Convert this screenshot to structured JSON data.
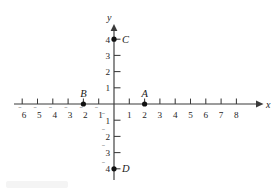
{
  "figure": {
    "background_color": "#ffffff",
    "line_color": "#3a3a3a",
    "point_color": "#111111",
    "text_color": "#262626"
  },
  "axes": {
    "x_axis_label": "x",
    "y_axis_label": "y",
    "origin_px": {
      "x": 114,
      "y": 104
    },
    "unit_px": {
      "x": 15.3,
      "y": 16.2
    },
    "x_range": [
      -6.6,
      9.4
    ],
    "y_range": [
      -4.8,
      4.7
    ],
    "x_tick_values": [
      -6,
      -5,
      -4,
      -3,
      -2,
      -1,
      1,
      2,
      3,
      4,
      5,
      6,
      7,
      8
    ],
    "y_tick_values": [
      4,
      3,
      2,
      1,
      -1,
      -2,
      -3,
      -4
    ],
    "x_tick_labels": [
      {
        "value": -6,
        "negative": true,
        "digits": "6"
      },
      {
        "value": -5,
        "negative": true,
        "digits": "5"
      },
      {
        "value": -4,
        "negative": true,
        "digits": "4"
      },
      {
        "value": -3,
        "negative": true,
        "digits": "3"
      },
      {
        "value": -2,
        "negative": true,
        "digits": "2"
      },
      {
        "value": -1,
        "negative": true,
        "digits": "1"
      },
      {
        "value": 1,
        "negative": false,
        "digits": "1"
      },
      {
        "value": 2,
        "negative": false,
        "digits": "2"
      },
      {
        "value": 3,
        "negative": false,
        "digits": "3"
      },
      {
        "value": 4,
        "negative": false,
        "digits": "4"
      },
      {
        "value": 5,
        "negative": false,
        "digits": "5"
      },
      {
        "value": 6,
        "negative": false,
        "digits": "6"
      },
      {
        "value": 7,
        "negative": false,
        "digits": "7"
      },
      {
        "value": 8,
        "negative": false,
        "digits": "8"
      }
    ],
    "y_tick_labels": [
      {
        "value": 4,
        "negative": false,
        "digits": "4"
      },
      {
        "value": 3,
        "negative": false,
        "digits": "3"
      },
      {
        "value": 2,
        "negative": false,
        "digits": "2"
      },
      {
        "value": 1,
        "negative": false,
        "digits": "1"
      },
      {
        "value": -1,
        "negative": true,
        "digits": "1"
      },
      {
        "value": -2,
        "negative": true,
        "digits": "2"
      },
      {
        "value": -3,
        "negative": true,
        "digits": "3"
      },
      {
        "value": -4,
        "negative": true,
        "digits": "4"
      }
    ],
    "minus_glyph": "⁻",
    "arrow_on_x_right": true,
    "arrow_on_y_top": true,
    "grid": false
  },
  "chart_data": {
    "type": "scatter",
    "title": "",
    "xlabel": "x",
    "ylabel": "y",
    "xlim": [
      -6.6,
      9.4
    ],
    "ylim": [
      -4.8,
      4.7
    ],
    "grid": false,
    "legend": "none",
    "points": [
      {
        "label": "A",
        "x": 2,
        "y": 0,
        "label_position": "above"
      },
      {
        "label": "B",
        "x": -2,
        "y": 0,
        "label_position": "above"
      },
      {
        "label": "C",
        "x": 0,
        "y": 4,
        "label_position": "right"
      },
      {
        "label": "D",
        "x": 0,
        "y": -4,
        "label_position": "right"
      }
    ]
  }
}
